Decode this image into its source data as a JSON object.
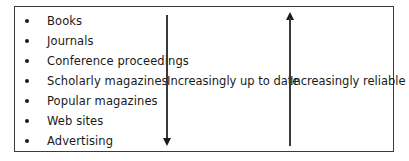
{
  "diagram": {
    "sources": [
      {
        "label": "Books"
      },
      {
        "label": "Journals"
      },
      {
        "label": "Conference proceedings"
      },
      {
        "label": "Scholarly magazines"
      },
      {
        "label": "Popular magazines"
      },
      {
        "label": "Web sites"
      },
      {
        "label": "Advertising"
      }
    ],
    "down_arrow": {
      "direction": "down",
      "label": "Increasingly up to date"
    },
    "up_arrow": {
      "direction": "up",
      "label": "Increasingly reliable"
    },
    "colors": {
      "border": "#3a3a3a",
      "text": "#1a1a1a",
      "background": "#ffffff"
    }
  }
}
